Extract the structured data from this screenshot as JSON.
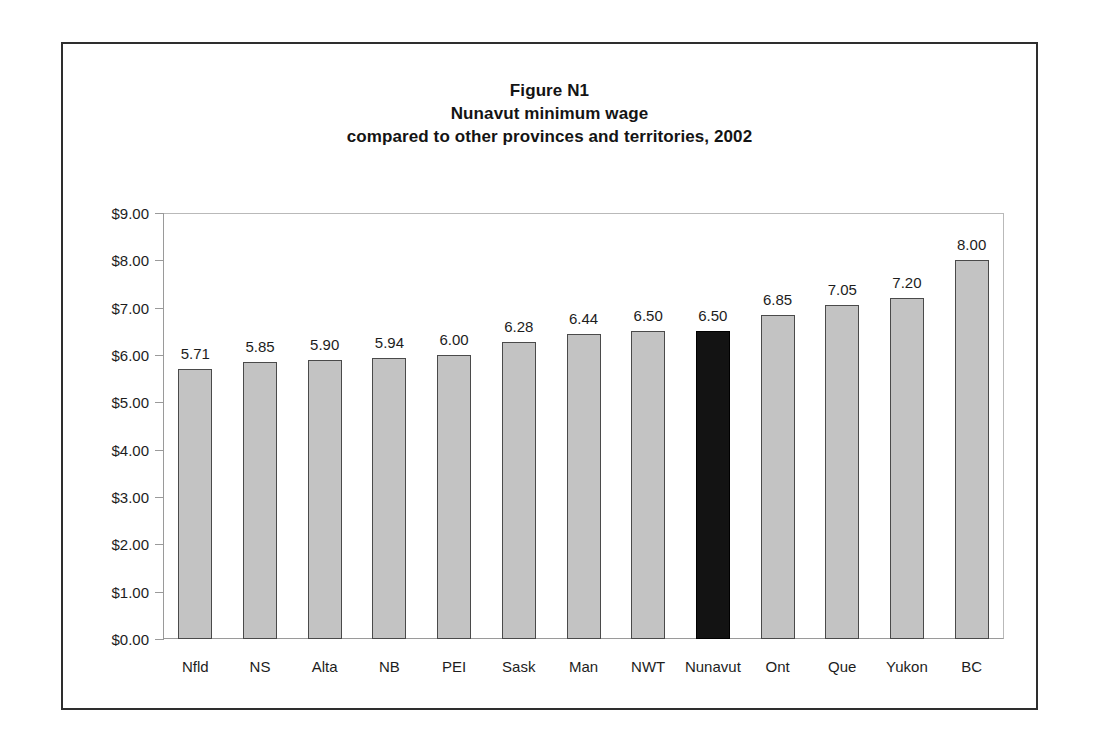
{
  "figure": {
    "title_lines": [
      "Figure N1",
      "Nunavut minimum wage",
      "compared to other provinces and territories, 2002"
    ]
  },
  "chart_data": {
    "type": "bar",
    "title": "Figure N1 Nunavut minimum wage compared to other provinces and territories, 2002",
    "xlabel": "",
    "ylabel": "",
    "ylim": [
      0,
      9
    ],
    "grid": false,
    "legend": "none",
    "categories": [
      "Nfld",
      "NS",
      "Alta",
      "NB",
      "PEI",
      "Sask",
      "Man",
      "NWT",
      "Nunavut",
      "Ont",
      "Que",
      "Yukon",
      "BC"
    ],
    "values": [
      5.71,
      5.85,
      5.9,
      5.94,
      6.0,
      6.28,
      6.44,
      6.5,
      6.5,
      6.85,
      7.05,
      7.2,
      8.0
    ],
    "value_labels": [
      "5.71",
      "5.85",
      "5.90",
      "5.94",
      "6.00",
      "6.28",
      "6.44",
      "6.50",
      "6.50",
      "6.85",
      "7.05",
      "7.20",
      "8.00"
    ],
    "highlight_category": "Nunavut",
    "highlight_index": 8,
    "ytick_values": [
      0,
      1,
      2,
      3,
      4,
      5,
      6,
      7,
      8,
      9
    ],
    "ytick_labels": [
      "$0.00",
      "$1.00",
      "$2.00",
      "$3.00",
      "$4.00",
      "$5.00",
      "$6.00",
      "$7.00",
      "$8.00",
      "$9.00"
    ],
    "colors": {
      "bar_fill": "#c3c3c3",
      "bar_border": "#4a4a4a",
      "highlight_fill": "#131313",
      "axis": "#9a9a9a",
      "text": "#1d1d1d",
      "frame": "#2e2e2e"
    }
  }
}
